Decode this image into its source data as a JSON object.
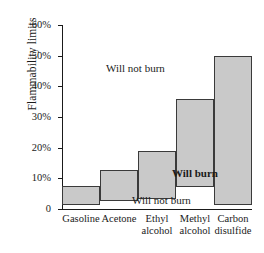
{
  "chart_data": {
    "type": "bar",
    "title": "",
    "subtitle": "",
    "xlabel": "",
    "ylabel": "Flammability limits",
    "ylim": [
      0,
      60
    ],
    "yunit": "%",
    "grid": false,
    "legend": "none",
    "orientation": "vertical",
    "bar_style": "floating range bars (lower and upper flammability limits)",
    "categories": [
      "Gasoline",
      "Acetone",
      "Ethyl alcohol",
      "Methyl alcohol",
      "Carbon disulfide"
    ],
    "category_lines": [
      [
        "Gasoline"
      ],
      [
        "Acetone"
      ],
      [
        "Ethyl",
        "alcohol"
      ],
      [
        "Methyl",
        "alcohol"
      ],
      [
        "Carbon",
        "disulfide"
      ]
    ],
    "series": [
      {
        "name": "Lower flammability limit",
        "values": [
          1.4,
          2.6,
          3.3,
          7.3,
          1.3
        ]
      },
      {
        "name": "Upper flammability limit",
        "values": [
          7.4,
          12.8,
          19.0,
          36.0,
          50.0
        ]
      }
    ],
    "yticks": [
      0,
      10,
      20,
      30,
      40,
      50,
      60
    ],
    "ytick_labels": [
      "0",
      "10%",
      "20%",
      "30%",
      "40%",
      "50%",
      "60%"
    ],
    "annotations": [
      {
        "text": "Will not burn",
        "region": "above-upper-limit"
      },
      {
        "text": "Will burn",
        "region": "inside-bars",
        "bold": true
      },
      {
        "text": "Will not burn",
        "region": "below-lower-limit"
      }
    ],
    "colors": {
      "bar_fill": "#c9c9c9",
      "bar_stroke": "#3a3a3a",
      "axis": "#1a1a1a",
      "text": "#1a1a1a",
      "background": "#ffffff"
    }
  }
}
